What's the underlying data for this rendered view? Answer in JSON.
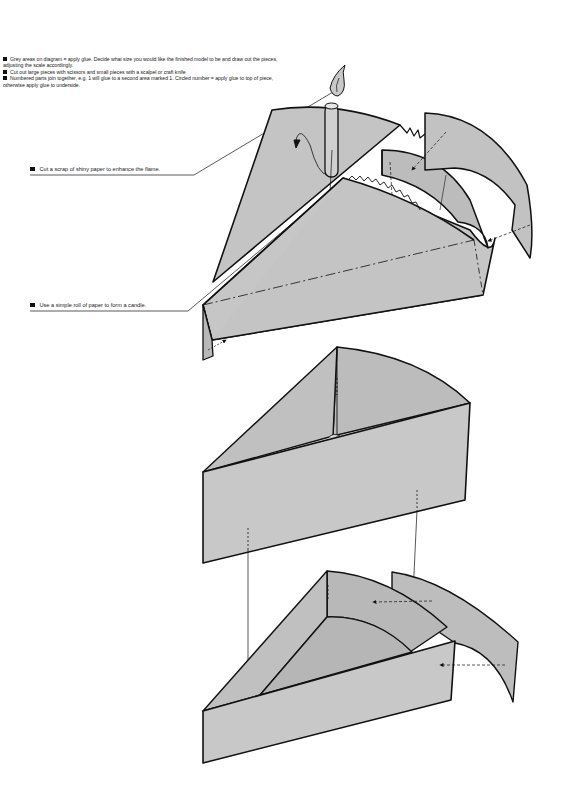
{
  "instructions": [
    {
      "icon": "bullet-square",
      "text": "Grey areas on diagram = apply glue. Decide what size you would like the finished model to be and draw out the pieces, adjusting the scale accordingly."
    },
    {
      "icon": "bullet-square",
      "text": "Cut out large pieces with scissors and small pieces with a scalpel or craft knife"
    },
    {
      "icon": "bullet-square",
      "text": "Numbered parts join together, e.g. 1 will glue to a second area marked 1. Circled number = apply glue to top of piece, otherwise apply glue to underside."
    }
  ],
  "callouts": {
    "flame": {
      "icon": "bullet-square",
      "text": "Cut a scrap of shiny paper to enhance the flame."
    },
    "candle": {
      "icon": "bullet-square",
      "text": "Use a simple roll of paper to form a candle."
    }
  },
  "colors": {
    "glue_grey": "#c4c4c4",
    "grey_dark": "#b4b4b4",
    "stroke": "#111111",
    "background": "#ffffff"
  },
  "diagrams": [
    {
      "name": "top-assembly",
      "label": "Cake slice top with candle and icing"
    },
    {
      "name": "middle-assembly",
      "label": "Cake slice middle layer"
    },
    {
      "name": "bottom-assembly",
      "label": "Cake slice base with curved back"
    }
  ]
}
